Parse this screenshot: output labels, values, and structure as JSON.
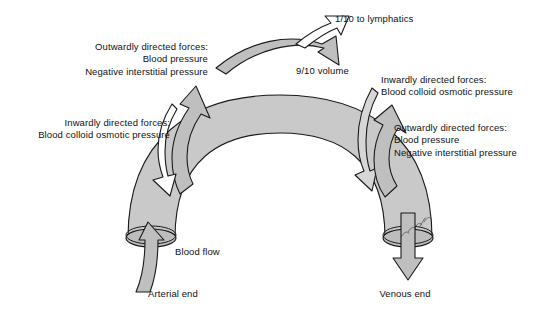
{
  "figure": {
    "colors": {
      "background": "#ffffff",
      "vessel_fill": "#c9c9c9",
      "arrow_fill": "#bfbfbf",
      "outline": "#1a1a1a",
      "text": "#111111"
    }
  },
  "labels": {
    "outward_left": {
      "line1": "Outwardly directed forces:",
      "line2": "Blood pressure",
      "line3": "Negative interstitial pressure"
    },
    "inward_left": {
      "line1": "Inwardly directed forces:",
      "line2": "Blood colloid osmotic pressure"
    },
    "inward_right": {
      "line1": "Inwardly directed forces:",
      "line2": "Blood colloid osmotic pressure"
    },
    "outward_right": {
      "line1": "Outwardly directed forces:",
      "line2": "Blood pressure",
      "line3": "Negative interstitial pressure"
    },
    "lymphatics": "1/10 to lymphatics",
    "volume": "9/10 volume",
    "blood_flow": "Blood flow",
    "arterial_end": "Arterial end",
    "venous_end": "Venous end"
  },
  "elements": {
    "capillary_arch": "capillary-arch",
    "arterial_opening": "arterial-end-opening",
    "venous_opening": "venous-end-opening",
    "arrow_blood_flow_in": "blood-flow-inflow-arrow",
    "arrow_blood_flow_out": "blood-flow-outflow-arrow",
    "arrow_outward_left": "outward-filtration-arrow-left",
    "arrow_inward_left": "inward-reabsorption-arrow-left",
    "arrow_inward_right": "inward-reabsorption-arrow-right",
    "arrow_outward_right": "outward-filtration-arrow-right",
    "arrow_lymphatics": "lymphatic-drainage-arrow",
    "arrow_volume": "reabsorbed-volume-arrow",
    "handwritten_mark": "handwritten-annotation"
  }
}
